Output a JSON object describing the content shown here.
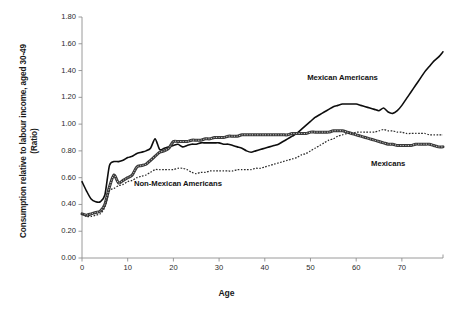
{
  "chart_data": {
    "type": "line",
    "title": "",
    "xlabel": "Age",
    "ylabel": "Consumption relative to labour income, aged 30-49 (Ratio)",
    "ylabel_line1": "Consumption relative to labour income, aged 30-49",
    "ylabel_line2": "(Ratio)",
    "xlim": [
      0,
      79
    ],
    "ylim": [
      0.0,
      1.8
    ],
    "xticks": [
      "0",
      "10",
      "20",
      "30",
      "40",
      "50",
      "60",
      "70"
    ],
    "xtick_values": [
      0,
      10,
      20,
      30,
      40,
      50,
      60,
      70
    ],
    "yticks": [
      "0.00",
      "0.20",
      "0.40",
      "0.60",
      "0.80",
      "1.00",
      "1.20",
      "1.40",
      "1.60",
      "1.80"
    ],
    "ytick_values": [
      0.0,
      0.2,
      0.4,
      0.6,
      0.8,
      1.0,
      1.2,
      1.4,
      1.6,
      1.8
    ],
    "grid": false,
    "legend_position": "inline-annotations",
    "annotations": [
      {
        "label": "Mexican Americans",
        "x": 57,
        "y": 1.35
      },
      {
        "label": "Mexicans",
        "x": 67,
        "y": 0.71
      },
      {
        "label": "Non-Mexican Americans",
        "x": 21,
        "y": 0.56
      }
    ],
    "series": [
      {
        "name": "Mexican Americans",
        "style": "solid",
        "color": "#0d0d0d",
        "x": [
          0,
          1,
          2,
          3,
          4,
          5,
          6,
          7,
          8,
          9,
          10,
          11,
          12,
          13,
          14,
          15,
          16,
          17,
          18,
          19,
          20,
          21,
          22,
          23,
          24,
          25,
          26,
          27,
          28,
          29,
          30,
          31,
          32,
          33,
          34,
          35,
          36,
          37,
          38,
          39,
          40,
          41,
          42,
          43,
          44,
          45,
          46,
          47,
          48,
          49,
          50,
          51,
          52,
          53,
          54,
          55,
          56,
          57,
          58,
          59,
          60,
          61,
          62,
          63,
          64,
          65,
          66,
          67,
          68,
          69,
          70,
          71,
          72,
          73,
          74,
          75,
          76,
          77,
          78,
          79
        ],
        "values": [
          0.57,
          0.5,
          0.44,
          0.42,
          0.42,
          0.47,
          0.69,
          0.72,
          0.72,
          0.73,
          0.75,
          0.76,
          0.78,
          0.79,
          0.8,
          0.82,
          0.89,
          0.81,
          0.82,
          0.83,
          0.84,
          0.85,
          0.83,
          0.84,
          0.85,
          0.85,
          0.86,
          0.86,
          0.86,
          0.86,
          0.86,
          0.85,
          0.85,
          0.84,
          0.83,
          0.82,
          0.8,
          0.79,
          0.8,
          0.81,
          0.82,
          0.83,
          0.84,
          0.85,
          0.87,
          0.89,
          0.91,
          0.93,
          0.96,
          0.99,
          1.02,
          1.05,
          1.07,
          1.09,
          1.11,
          1.13,
          1.14,
          1.15,
          1.15,
          1.15,
          1.15,
          1.14,
          1.13,
          1.12,
          1.11,
          1.1,
          1.12,
          1.09,
          1.08,
          1.1,
          1.14,
          1.19,
          1.24,
          1.29,
          1.34,
          1.39,
          1.43,
          1.47,
          1.5,
          1.54
        ]
      },
      {
        "name": "Mexicans",
        "style": "thick-textured",
        "color": "#3a3a3a",
        "x": [
          0,
          1,
          2,
          3,
          4,
          5,
          6,
          7,
          8,
          9,
          10,
          11,
          12,
          13,
          14,
          15,
          16,
          17,
          18,
          19,
          20,
          21,
          22,
          23,
          24,
          25,
          26,
          27,
          28,
          29,
          30,
          31,
          32,
          33,
          34,
          35,
          36,
          37,
          38,
          39,
          40,
          41,
          42,
          43,
          44,
          45,
          46,
          47,
          48,
          49,
          50,
          51,
          52,
          53,
          54,
          55,
          56,
          57,
          58,
          59,
          60,
          61,
          62,
          63,
          64,
          65,
          66,
          67,
          68,
          69,
          70,
          71,
          72,
          73,
          74,
          75,
          76,
          77,
          78,
          79
        ],
        "values": [
          0.33,
          0.32,
          0.33,
          0.34,
          0.35,
          0.4,
          0.53,
          0.62,
          0.56,
          0.58,
          0.6,
          0.62,
          0.68,
          0.69,
          0.7,
          0.73,
          0.76,
          0.79,
          0.8,
          0.82,
          0.87,
          0.87,
          0.87,
          0.87,
          0.88,
          0.88,
          0.88,
          0.89,
          0.89,
          0.9,
          0.9,
          0.9,
          0.91,
          0.91,
          0.91,
          0.92,
          0.92,
          0.92,
          0.92,
          0.92,
          0.92,
          0.92,
          0.92,
          0.92,
          0.92,
          0.92,
          0.93,
          0.93,
          0.93,
          0.93,
          0.94,
          0.94,
          0.94,
          0.94,
          0.94,
          0.95,
          0.95,
          0.95,
          0.94,
          0.93,
          0.92,
          0.91,
          0.9,
          0.89,
          0.88,
          0.87,
          0.86,
          0.85,
          0.85,
          0.84,
          0.84,
          0.84,
          0.84,
          0.85,
          0.85,
          0.85,
          0.85,
          0.84,
          0.83,
          0.83
        ]
      },
      {
        "name": "Non-Mexican Americans",
        "style": "dotted",
        "color": "#2a2a2a",
        "x": [
          0,
          1,
          2,
          3,
          4,
          5,
          6,
          7,
          8,
          9,
          10,
          11,
          12,
          13,
          14,
          15,
          16,
          17,
          18,
          19,
          20,
          21,
          22,
          23,
          24,
          25,
          26,
          27,
          28,
          29,
          30,
          31,
          32,
          33,
          34,
          35,
          36,
          37,
          38,
          39,
          40,
          41,
          42,
          43,
          44,
          45,
          46,
          47,
          48,
          49,
          50,
          51,
          52,
          53,
          54,
          55,
          56,
          57,
          58,
          59,
          60,
          61,
          62,
          63,
          64,
          65,
          66,
          67,
          68,
          69,
          70,
          71,
          72,
          73,
          74,
          75,
          76,
          77,
          78,
          79
        ],
        "values": [
          0.33,
          0.31,
          0.31,
          0.32,
          0.33,
          0.38,
          0.5,
          0.52,
          0.54,
          0.55,
          0.57,
          0.58,
          0.6,
          0.61,
          0.62,
          0.64,
          0.66,
          0.66,
          0.66,
          0.66,
          0.66,
          0.67,
          0.67,
          0.66,
          0.64,
          0.63,
          0.64,
          0.64,
          0.65,
          0.65,
          0.65,
          0.65,
          0.65,
          0.65,
          0.66,
          0.66,
          0.66,
          0.66,
          0.67,
          0.67,
          0.68,
          0.69,
          0.7,
          0.71,
          0.72,
          0.73,
          0.74,
          0.75,
          0.77,
          0.78,
          0.8,
          0.82,
          0.84,
          0.86,
          0.88,
          0.89,
          0.91,
          0.92,
          0.93,
          0.93,
          0.94,
          0.94,
          0.94,
          0.94,
          0.94,
          0.95,
          0.96,
          0.95,
          0.95,
          0.94,
          0.94,
          0.93,
          0.93,
          0.93,
          0.93,
          0.93,
          0.92,
          0.92,
          0.92,
          0.92
        ]
      }
    ]
  },
  "axes": {
    "x_axis_name": "Age",
    "y_axis_name": "Consumption relative to labour income, aged 30-49 (Ratio)"
  },
  "caption": {
    "text": ""
  }
}
